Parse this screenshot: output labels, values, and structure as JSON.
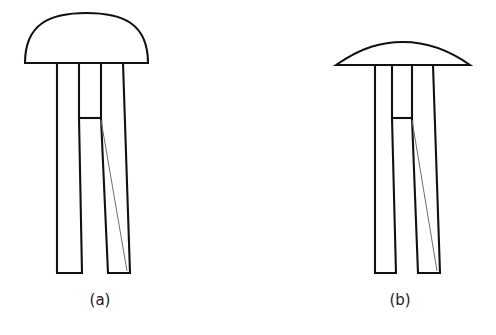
{
  "figure": {
    "background_color": "#ffffff",
    "line_color": "#111111",
    "hairline_color": "#6e6e6e",
    "panels": [
      {
        "id": "a",
        "label": "(a)",
        "label_x": 100,
        "label_y": 305,
        "cap_shape": "domed-semicircular",
        "cap_left_x": 25,
        "cap_right_x": 148,
        "cap_baseline_y": 63,
        "cap_apex_y": 14,
        "stem_left_x": 57,
        "stem_right_x": 123,
        "leg_bottom_y": 273,
        "slot_top_y": 118,
        "slot_left_x": 79,
        "slot_right_x": 101,
        "left_leg_bottom_left_x": 57,
        "left_leg_bottom_right_x": 82,
        "right_leg_bottom_left_x": 108,
        "right_leg_bottom_right_x": 130
      },
      {
        "id": "b",
        "label": "(b)",
        "label_x": 400,
        "label_y": 305,
        "cap_shape": "shallow-flat-arc",
        "cap_left_x": 336,
        "cap_right_x": 470,
        "cap_baseline_y": 65,
        "cap_apex_y": 42,
        "stem_left_x": 375,
        "stem_right_x": 433,
        "leg_bottom_y": 273,
        "slot_top_y": 118,
        "slot_left_x": 392,
        "slot_right_x": 412,
        "left_leg_bottom_left_x": 375,
        "left_leg_bottom_right_x": 396,
        "right_leg_bottom_left_x": 418,
        "right_leg_bottom_right_x": 440
      }
    ]
  }
}
